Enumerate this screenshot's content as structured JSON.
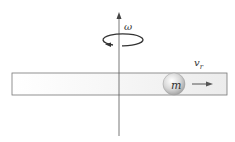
{
  "diagram": {
    "labels": {
      "omega": "ω",
      "radial_velocity": "v",
      "radial_velocity_subscript": "r",
      "mass": "m"
    },
    "colors": {
      "line": "#555555",
      "rod_fill": "#f4f4f4",
      "rod_border": "#777777",
      "mass_fill": "#dcdcdc"
    }
  }
}
